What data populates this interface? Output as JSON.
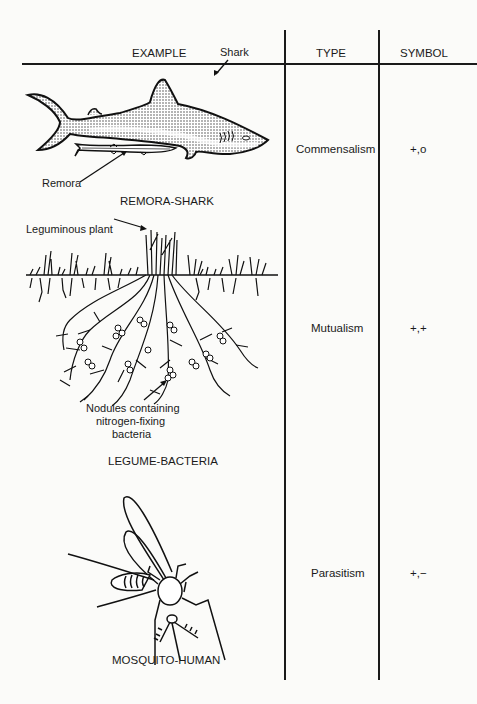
{
  "table": {
    "headers": {
      "example": "EXAMPLE",
      "type": "TYPE",
      "symbol": "SYMBOL"
    },
    "rows": [
      {
        "example_caption": "REMORA-SHARK",
        "labels": {
          "shark": "Shark",
          "remora": "Remora"
        },
        "type": "Commensalism",
        "symbol": "+,o"
      },
      {
        "example_caption": "LEGUME-BACTERIA",
        "labels": {
          "plant": "Leguminous plant",
          "nodules_line1": "Nodules containing",
          "nodules_line2": "nitrogen-fixing",
          "nodules_line3": "bacteria"
        },
        "type": "Mutualism",
        "symbol": "+,+"
      },
      {
        "example_caption": "MOSQUITO-HUMAN",
        "type": "Parasitism",
        "symbol": "+,−"
      }
    ]
  }
}
